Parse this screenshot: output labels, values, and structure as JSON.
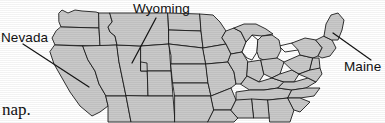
{
  "figure": {
    "kind": "united-states-map",
    "background_color": "#ffffff",
    "state_fill_color": "#c9c9c9",
    "outline_color": "#1c1c1c",
    "lake_color": "#ffffff"
  },
  "callouts": [
    {
      "id": "nevada",
      "label": "Nevada",
      "leader_from_x": 23,
      "leader_from_y": 44,
      "leader_to_x": 89,
      "leader_to_y": 87
    },
    {
      "id": "wyoming",
      "label": "Wyoming",
      "leader_from_x": 156,
      "leader_from_y": 18,
      "leader_to_x": 132,
      "leader_to_y": 63
    },
    {
      "id": "maine",
      "label": "Maine",
      "leader_from_x": 333,
      "leader_from_y": 33,
      "leader_to_x": 371,
      "leader_to_y": 60
    }
  ],
  "caption": {
    "fragment": "nap."
  }
}
